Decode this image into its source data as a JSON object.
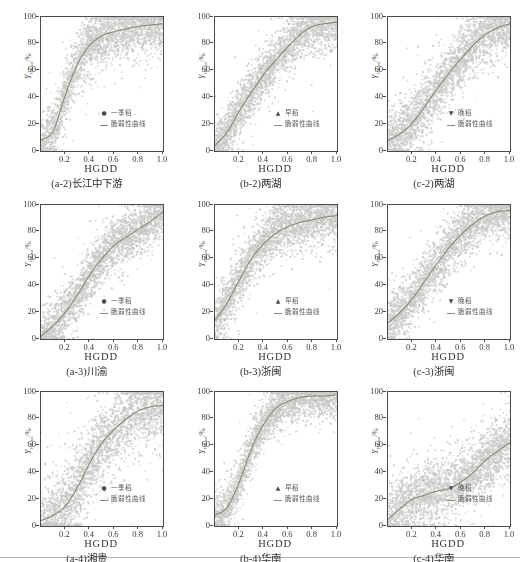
{
  "figure": {
    "x_label": "HGDD",
    "y_label": {
      "main": "Y",
      "sub": "Hloss",
      "suffix": "/%"
    },
    "x_ticks": [
      "0.2",
      "0.4",
      "0.6",
      "0.8",
      "1.0"
    ],
    "y_ticks": [
      "0",
      "20",
      "40",
      "60",
      "80",
      "100"
    ],
    "x_tick_values": [
      0.2,
      0.4,
      0.6,
      0.8,
      1.0
    ],
    "y_tick_values": [
      0,
      20,
      40,
      60,
      80,
      100
    ],
    "legend_curve_label": "脆弱性曲线",
    "marker_glyphs": {
      "dot": "●",
      "triangle-up": "▲",
      "triangle-down": "▼"
    },
    "colors": {
      "scatter": "#c8c9c7",
      "curve": "#8e8679",
      "axis": "#4a4a4a",
      "text": "#333333",
      "legend_text": "#5a5a5a",
      "separator": "#a5a5a5"
    }
  },
  "chart_data": [
    {
      "type": "scatter",
      "code": "a-2",
      "caption": "(a-2)长江中下游",
      "xlabel": "HGDD",
      "ylabel": "YHloss/%",
      "xlim": [
        0,
        1
      ],
      "ylim": [
        0,
        100
      ],
      "series": [
        {
          "name": "一季稻",
          "marker": "dot",
          "role": "samples"
        },
        {
          "name": "脆弱性曲线",
          "role": "fit-curve"
        }
      ],
      "curve_x": [
        0,
        0.1,
        0.2,
        0.3,
        0.4,
        0.5,
        0.6,
        0.7,
        0.8,
        0.9,
        1.0
      ],
      "curve_y": [
        8,
        15,
        42,
        65,
        79,
        86,
        89,
        91,
        93,
        94,
        95
      ],
      "scatter": {
        "n": 2600,
        "sigma": 10,
        "seed": 101
      }
    },
    {
      "type": "scatter",
      "code": "b-2",
      "caption": "(b-2)两湖",
      "xlabel": "HGDD",
      "ylabel": "YHloss/%",
      "xlim": [
        0,
        1
      ],
      "ylim": [
        0,
        100
      ],
      "series": [
        {
          "name": "早稻",
          "marker": "triangle-up",
          "role": "samples"
        },
        {
          "name": "脆弱性曲线",
          "role": "fit-curve"
        }
      ],
      "curve_x": [
        0,
        0.1,
        0.2,
        0.3,
        0.4,
        0.5,
        0.6,
        0.7,
        0.8,
        0.9,
        1.0
      ],
      "curve_y": [
        4,
        14,
        30,
        44,
        57,
        68,
        78,
        87,
        93,
        95,
        96
      ],
      "scatter": {
        "n": 2600,
        "sigma": 9,
        "seed": 202
      }
    },
    {
      "type": "scatter",
      "code": "c-2",
      "caption": "(c-2)两湖",
      "xlabel": "HGDD",
      "ylabel": "YHloss/%",
      "xlim": [
        0,
        1
      ],
      "ylim": [
        0,
        100
      ],
      "series": [
        {
          "name": "晚稻",
          "marker": "triangle-down",
          "role": "samples"
        },
        {
          "name": "脆弱性曲线",
          "role": "fit-curve"
        }
      ],
      "curve_x": [
        0,
        0.1,
        0.2,
        0.3,
        0.4,
        0.5,
        0.6,
        0.7,
        0.8,
        0.9,
        1.0
      ],
      "curve_y": [
        8,
        13,
        21,
        33,
        46,
        58,
        69,
        79,
        87,
        92,
        95
      ],
      "scatter": {
        "n": 2600,
        "sigma": 10,
        "seed": 303
      }
    },
    {
      "type": "scatter",
      "code": "a-3",
      "caption": "(a-3)川渝",
      "xlabel": "HGDD",
      "ylabel": "YHloss/%",
      "xlim": [
        0,
        1
      ],
      "ylim": [
        0,
        100
      ],
      "series": [
        {
          "name": "一季稻",
          "marker": "dot",
          "role": "samples"
        },
        {
          "name": "脆弱性曲线",
          "role": "fit-curve"
        }
      ],
      "curve_x": [
        0,
        0.1,
        0.2,
        0.3,
        0.4,
        0.5,
        0.6,
        0.7,
        0.8,
        0.9,
        1.0
      ],
      "curve_y": [
        2,
        10,
        20,
        33,
        48,
        60,
        70,
        76,
        82,
        88,
        95
      ],
      "scatter": {
        "n": 2600,
        "sigma": 9,
        "seed": 404
      }
    },
    {
      "type": "scatter",
      "code": "b-3",
      "caption": "(b-3)浙闽",
      "xlabel": "HGDD",
      "ylabel": "YHloss/%",
      "xlim": [
        0,
        1
      ],
      "ylim": [
        0,
        100
      ],
      "series": [
        {
          "name": "早稻",
          "marker": "triangle-up",
          "role": "samples"
        },
        {
          "name": "脆弱性曲线",
          "role": "fit-curve"
        }
      ],
      "curve_x": [
        0,
        0.1,
        0.2,
        0.3,
        0.4,
        0.5,
        0.6,
        0.7,
        0.8,
        0.9,
        1.0
      ],
      "curve_y": [
        14,
        27,
        44,
        60,
        71,
        79,
        84,
        87,
        89,
        91,
        92
      ],
      "scatter": {
        "n": 2600,
        "sigma": 9,
        "seed": 505
      }
    },
    {
      "type": "scatter",
      "code": "c-3",
      "caption": "(c-3)浙闽",
      "xlabel": "HGDD",
      "ylabel": "YHloss/%",
      "xlim": [
        0,
        1
      ],
      "ylim": [
        0,
        100
      ],
      "series": [
        {
          "name": "晚稻",
          "marker": "triangle-down",
          "role": "samples"
        },
        {
          "name": "脆弱性曲线",
          "role": "fit-curve"
        }
      ],
      "curve_x": [
        0,
        0.1,
        0.2,
        0.3,
        0.4,
        0.5,
        0.6,
        0.7,
        0.8,
        0.9,
        1.0
      ],
      "curve_y": [
        12,
        20,
        30,
        43,
        56,
        68,
        78,
        86,
        92,
        95,
        96
      ],
      "scatter": {
        "n": 2600,
        "sigma": 9,
        "seed": 606
      }
    },
    {
      "type": "scatter",
      "code": "a-4",
      "caption": "(a-4)湘贵",
      "xlabel": "HGDD",
      "ylabel": "YHloss/%",
      "xlim": [
        0,
        1
      ],
      "ylim": [
        0,
        100
      ],
      "series": [
        {
          "name": "一季稻",
          "marker": "dot",
          "role": "samples"
        },
        {
          "name": "脆弱性曲线",
          "role": "fit-curve"
        }
      ],
      "curve_x": [
        0,
        0.1,
        0.2,
        0.3,
        0.4,
        0.5,
        0.6,
        0.7,
        0.8,
        0.9,
        1.0
      ],
      "curve_y": [
        4,
        8,
        15,
        29,
        47,
        62,
        72,
        80,
        86,
        89,
        90
      ],
      "scatter": {
        "n": 2600,
        "sigma": 13,
        "seed": 707
      }
    },
    {
      "type": "scatter",
      "code": "b-4",
      "caption": "(b-4)华南",
      "xlabel": "HGDD",
      "ylabel": "YHloss/%",
      "xlim": [
        0,
        1
      ],
      "ylim": [
        0,
        100
      ],
      "series": [
        {
          "name": "早稻",
          "marker": "triangle-up",
          "role": "samples"
        },
        {
          "name": "脆弱性曲线",
          "role": "fit-curve"
        }
      ],
      "curve_x": [
        0,
        0.1,
        0.2,
        0.3,
        0.4,
        0.5,
        0.6,
        0.7,
        0.8,
        0.9,
        1.0
      ],
      "curve_y": [
        8,
        14,
        33,
        58,
        76,
        88,
        93,
        96,
        97,
        97,
        98
      ],
      "scatter": {
        "n": 2600,
        "sigma": 8,
        "seed": 808
      }
    },
    {
      "type": "scatter",
      "code": "c-4",
      "caption": "(c-4)华南",
      "xlabel": "HGDD",
      "ylabel": "YHloss/%",
      "xlim": [
        0,
        1
      ],
      "ylim": [
        0,
        100
      ],
      "series": [
        {
          "name": "晚稻",
          "marker": "triangle-down",
          "role": "samples"
        },
        {
          "name": "脆弱性曲线",
          "role": "fit-curve"
        }
      ],
      "curve_x": [
        0,
        0.1,
        0.2,
        0.3,
        0.4,
        0.5,
        0.6,
        0.7,
        0.8,
        0.9,
        1.0
      ],
      "curve_y": [
        5,
        13,
        20,
        23,
        26,
        28,
        33,
        40,
        49,
        56,
        62
      ],
      "scatter": {
        "n": 2600,
        "sigma": 11,
        "seed": 909
      }
    }
  ]
}
